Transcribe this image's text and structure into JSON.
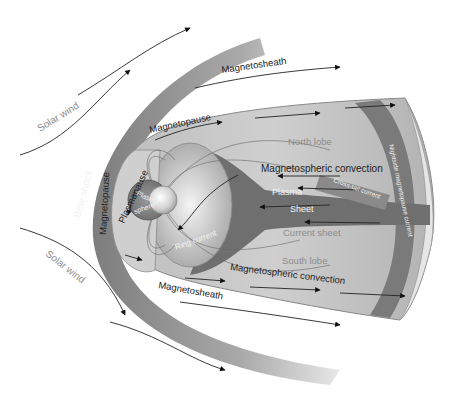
{
  "diagram": {
    "labels": {
      "solar_wind_top": "Solar wind",
      "solar_wind_bottom": "Solar wind",
      "bow_shock": "Bow shock",
      "magnetopause_left": "Magnetopause",
      "magnetopause_top": "Magnetopause",
      "plasmapause": "Plasmapause",
      "plasmasphere_1": "Plasma",
      "plasmasphere_2": "sphere",
      "magnetosheath_top": "Magnetosheath",
      "magnetosheath_bottom": "Magnetosheath",
      "north_lobe": "North lobe",
      "south_lobe": "South lobe",
      "convection_top": "Magnetospheric convection",
      "convection_bottom": "Magnetospheric convection",
      "plasma": "Plasma",
      "sheet": "Sheet",
      "current_sheet": "Current sheet",
      "cross_tail_current": "Cross-tail current",
      "nightside_current": "Nightside magnetopause current",
      "ring_current": "Ring current"
    },
    "colors": {
      "bow_shock": "#8a8a8a",
      "magnetosphere_fill": "#c4c4c4",
      "tail_dark": "#6e6e6e",
      "label_dark": "#222222",
      "label_light": "#8c8c8c",
      "label_white": "#f2f2f2"
    }
  }
}
